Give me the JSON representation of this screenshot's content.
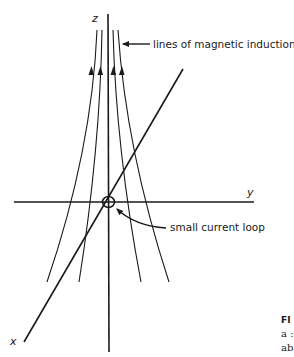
{
  "figure": {
    "axes": {
      "z_label": "z",
      "y_label": "y",
      "x_label": "x"
    },
    "annotations": {
      "field_lines_label": "lines of magnetic induction",
      "loop_label": "small current loop"
    },
    "caption": {
      "title_fragment": "FI",
      "line2_fragment": "a :",
      "line3_fragment": "ab"
    },
    "colors": {
      "ink": "#1a1a1a",
      "background": "#ffffff"
    }
  }
}
